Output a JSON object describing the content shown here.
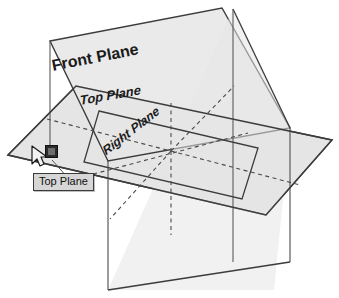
{
  "scene": {
    "title": "3D reference planes view",
    "background_color": "#ffffff",
    "plane_fill_color": "#e3e3e3",
    "plane_edge_color": "#3c3c3c",
    "dashed_line_color": "#4a4a4a"
  },
  "labels": {
    "front_plane": "Front Plane",
    "top_plane": "Top Plane",
    "right_plane": "Right Plane"
  },
  "tooltip": {
    "text": "Top Plane",
    "background_color": "#d6d6d6",
    "border_color": "#3a3a3a"
  },
  "selection": {
    "handle_name": "selection-handle",
    "handle_color": "#2b2b2b",
    "inner_color": "#6d6d6d"
  },
  "cursor": {
    "type": "arrow-pointer"
  },
  "geometry": {
    "front_plane_points": "50,41 222,8 290,128 108,161",
    "top_plane_points": "8,155 76,86 332,140 266,215",
    "right_plane_points": "233,9 290,128 274,290 108,290",
    "top_plane_inner_points": "99,111 258,148 242,199 84,162",
    "front_plane_left_edge": "50,41 50,152",
    "right_plane_left_edge": "108,161 108,290",
    "right_plane_right_edge": "290,128 290,262",
    "dashed_segments": [
      "47,119 171,151",
      "171,151 296,184",
      "171,151 171,103",
      "171,151 171,230",
      "171,151 113,215",
      "171,151 232,88",
      "86,175 247,133",
      "100,93 260,132"
    ]
  },
  "overlay_graphics": {
    "leader_line": "58,158 72,178"
  }
}
